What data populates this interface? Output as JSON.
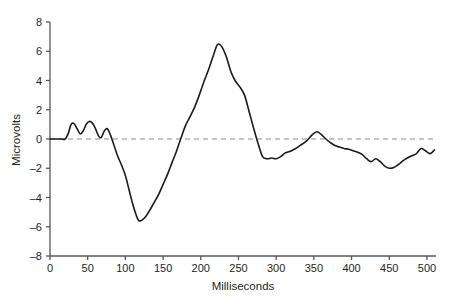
{
  "chart_data": {
    "type": "line",
    "title": "",
    "subtitle": "",
    "xlabel": "Milliseconds",
    "ylabel": "Microvolts",
    "xlim": [
      0,
      512
    ],
    "ylim": [
      -8,
      8
    ],
    "grid": false,
    "legend": null,
    "annotations": [
      {
        "name": "zero-reference-line",
        "type": "hline",
        "y": 0,
        "style": "dashed",
        "color": "#8c8c8c"
      }
    ],
    "xticks": [
      0,
      50,
      100,
      150,
      200,
      250,
      300,
      350,
      400,
      450,
      500
    ],
    "xtick_labels": [
      "0",
      "50",
      "100",
      "150",
      "200",
      "250",
      "300",
      "350",
      "400",
      "450",
      "500"
    ],
    "yticks": [
      -8,
      -6,
      -4,
      -2,
      0,
      2,
      4,
      6,
      8
    ],
    "ytick_labels": [
      "–8",
      "–6",
      "–4",
      "–2",
      "0",
      "2",
      "4",
      "6",
      "8"
    ],
    "series": [
      {
        "name": "erp-waveform",
        "color": "#1a1a1a",
        "x": [
          0,
          5,
          10,
          15,
          20,
          24,
          28,
          32,
          36,
          40,
          44,
          48,
          52,
          56,
          60,
          64,
          68,
          72,
          76,
          80,
          85,
          90,
          95,
          100,
          105,
          110,
          115,
          118,
          122,
          127,
          132,
          138,
          144,
          150,
          156,
          162,
          168,
          174,
          180,
          186,
          192,
          198,
          204,
          210,
          216,
          222,
          228,
          234,
          240,
          246,
          252,
          258,
          264,
          270,
          276,
          282,
          288,
          294,
          300,
          306,
          312,
          318,
          324,
          330,
          336,
          342,
          348,
          354,
          360,
          366,
          372,
          378,
          384,
          390,
          396,
          402,
          408,
          414,
          420,
          426,
          432,
          438,
          444,
          450,
          456,
          462,
          468,
          474,
          480,
          486,
          492,
          498,
          504,
          510
        ],
        "y": [
          0.0,
          0.0,
          0.0,
          0.0,
          0.0,
          0.35,
          1.0,
          1.05,
          0.7,
          0.35,
          0.55,
          1.0,
          1.2,
          1.1,
          0.75,
          0.25,
          0.1,
          0.55,
          0.7,
          0.3,
          -0.45,
          -1.2,
          -1.8,
          -2.5,
          -3.5,
          -4.5,
          -5.3,
          -5.6,
          -5.55,
          -5.3,
          -4.9,
          -4.35,
          -3.8,
          -3.1,
          -2.4,
          -1.6,
          -0.8,
          0.1,
          0.95,
          1.55,
          2.2,
          3.0,
          3.9,
          4.7,
          5.6,
          6.45,
          6.3,
          5.6,
          4.6,
          3.95,
          3.55,
          3.0,
          1.9,
          0.75,
          -0.3,
          -1.2,
          -1.35,
          -1.3,
          -1.35,
          -1.2,
          -0.95,
          -0.85,
          -0.7,
          -0.5,
          -0.3,
          -0.05,
          0.3,
          0.5,
          0.3,
          0.0,
          -0.25,
          -0.45,
          -0.55,
          -0.65,
          -0.7,
          -0.8,
          -0.9,
          -1.05,
          -1.35,
          -1.55,
          -1.35,
          -1.55,
          -1.85,
          -2.0,
          -1.95,
          -1.75,
          -1.5,
          -1.3,
          -1.15,
          -1.0,
          -0.65,
          -0.8,
          -1.0,
          -0.75
        ]
      }
    ]
  },
  "axes": {
    "y_axis_title": "Microvolts",
    "x_axis_title": "Milliseconds"
  },
  "colors": {
    "waveform": "#1a1a1a",
    "zero_line": "#8c8c8c",
    "axis": "#58585a",
    "background": "#ffffff",
    "text": "#231f20"
  }
}
